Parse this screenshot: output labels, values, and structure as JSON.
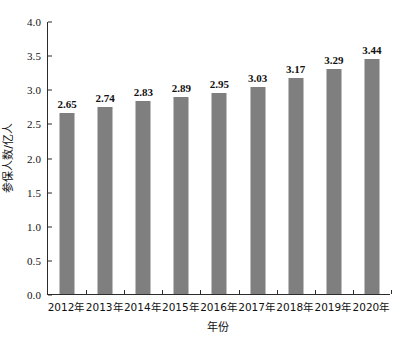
{
  "chart_data": {
    "type": "bar",
    "title": "",
    "xlabel": "年份",
    "ylabel": "参保人数/亿人",
    "categories": [
      "2012年",
      "2013年",
      "2014年",
      "2015年",
      "2016年",
      "2017年",
      "2018年",
      "2019年",
      "2020年"
    ],
    "values": [
      2.65,
      2.74,
      2.83,
      2.89,
      2.95,
      3.03,
      3.17,
      3.29,
      3.44
    ],
    "value_labels": [
      "2.65",
      "2.74",
      "2.83",
      "2.89",
      "2.95",
      "3.03",
      "3.17",
      "3.29",
      "3.44"
    ],
    "ylim": [
      0.0,
      4.0
    ],
    "ytick_values": [
      0.0,
      0.5,
      1.0,
      1.5,
      2.0,
      2.5,
      3.0,
      3.5,
      4.0
    ],
    "ytick_labels": [
      "0.0",
      "0.5",
      "1.0",
      "1.5",
      "2.0",
      "2.5",
      "3.0",
      "3.5",
      "4.0"
    ],
    "grid": false,
    "legend": false,
    "bar_color": "#7f7f7f",
    "axis_color": "#2b2b2b",
    "text_color": "#111111",
    "background": "#ffffff"
  }
}
